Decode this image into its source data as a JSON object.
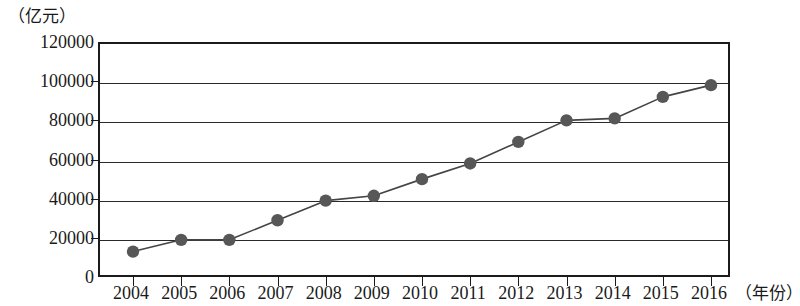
{
  "chart_data": {
    "type": "line",
    "title": "",
    "subtitle": "",
    "xlabel": "（年份）",
    "ylabel": "（亿元）",
    "x": [
      2004,
      2005,
      2006,
      2007,
      2008,
      2009,
      2010,
      2011,
      2012,
      2013,
      2014,
      2015,
      2016
    ],
    "categories": [
      "2004",
      "2005",
      "2006",
      "2007",
      "2008",
      "2009",
      "2010",
      "2011",
      "2012",
      "2013",
      "2014",
      "2015",
      "2016"
    ],
    "values": [
      14000,
      20000,
      20000,
      30000,
      40000,
      42500,
      51000,
      59000,
      70000,
      81000,
      82000,
      93000,
      99000
    ],
    "series": [
      {
        "name": "",
        "values": [
          14000,
          20000,
          20000,
          30000,
          40000,
          42500,
          51000,
          59000,
          70000,
          81000,
          82000,
          93000,
          99000
        ]
      }
    ],
    "ylim": [
      0,
      120000
    ],
    "y_ticks": [
      0,
      20000,
      40000,
      60000,
      80000,
      100000,
      120000
    ],
    "y_tick_labels": [
      "0",
      "20000",
      "40000",
      "60000",
      "80000",
      "100000",
      "120000"
    ],
    "xlim": [
      2004,
      2016
    ],
    "grid": "horizontal",
    "legend": "none",
    "marker": "circle",
    "marker_color": "#575757",
    "line_color": "#444444"
  }
}
